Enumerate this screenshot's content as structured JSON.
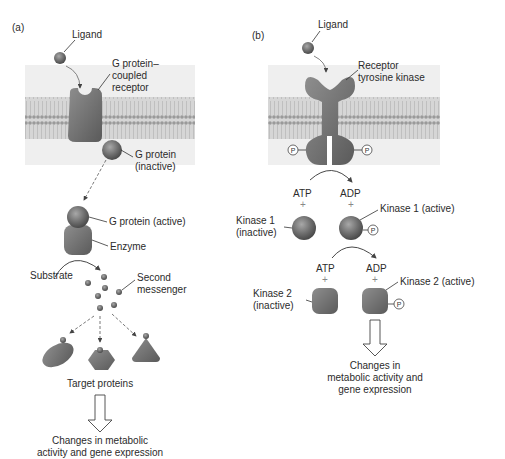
{
  "panel_a": {
    "tag": "(a)",
    "ligand": "Ligand",
    "receptor_line1": "G protein–",
    "receptor_line2": "coupled",
    "receptor_line3": "receptor",
    "g_inactive_line1": "G protein",
    "g_inactive_line2": "(inactive)",
    "g_active": "G protein (active)",
    "enzyme": "Enzyme",
    "substrate": "Substrate",
    "second_line1": "Second",
    "second_line2": "messenger",
    "targets": "Target proteins",
    "result_line1": "Changes in metabolic",
    "result_line2": "activity and gene expression"
  },
  "panel_b": {
    "tag": "(b)",
    "ligand": "Ligand",
    "receptor_line1": "Receptor",
    "receptor_line2": "tyrosine kinase",
    "atp1": "ATP",
    "adp1": "ADP",
    "plus": "+",
    "k1_inactive_line1": "Kinase 1",
    "k1_inactive_line2": "(inactive)",
    "k1_active": "Kinase 1 (active)",
    "atp2": "ATP",
    "adp2": "ADP",
    "k2_inactive_line1": "Kinase 2",
    "k2_inactive_line2": "(inactive)",
    "k2_active": "Kinase 2 (active)",
    "phosphate": "P",
    "result_line1": "Changes in",
    "result_line2": "metabolic activity and",
    "result_line3": "gene expression"
  },
  "colors": {
    "membrane_bg": "#e9e9e9",
    "protein_fill": "#7a7a7a",
    "protein_dark": "#5c5c5c",
    "line": "#333333"
  }
}
